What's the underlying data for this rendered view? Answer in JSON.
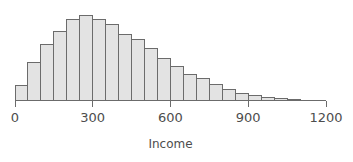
{
  "chart_data": {
    "type": "bar",
    "title": "",
    "subtitle": "",
    "xlabel": "Income",
    "ylabel": "",
    "grid": false,
    "legend": false,
    "legend_position": "none",
    "orientation": "vertical",
    "bin_width": 50,
    "xlim": [
      0,
      1200
    ],
    "ylim": [
      0,
      1
    ],
    "xticks": [
      0,
      300,
      600,
      900,
      1200
    ],
    "xtick_labels": [
      "0",
      "300",
      "600",
      "900",
      "1200"
    ],
    "yticks": [],
    "ytick_labels": [],
    "bar_fill_color": "#e3e3e3",
    "bar_edge_color": "#6b6b6b",
    "axis_color": "#6b6b6b",
    "text_color": "#4d4d4d",
    "background_color": "#ffffff",
    "bin_starts": [
      0,
      50,
      100,
      150,
      200,
      250,
      300,
      350,
      400,
      450,
      500,
      550,
      600,
      650,
      700,
      750,
      800,
      850,
      900,
      950,
      1000,
      1050,
      1100
    ],
    "bin_ends": [
      50,
      100,
      150,
      200,
      250,
      300,
      350,
      400,
      450,
      500,
      550,
      600,
      650,
      700,
      750,
      800,
      850,
      900,
      950,
      1000,
      1050,
      1100,
      1150
    ],
    "categories": [
      "0-50",
      "50-100",
      "100-150",
      "150-200",
      "200-250",
      "250-300",
      "300-350",
      "350-400",
      "400-450",
      "450-500",
      "500-550",
      "550-600",
      "600-650",
      "650-700",
      "700-750",
      "750-800",
      "800-850",
      "850-900",
      "900-950",
      "950-1000",
      "1000-1050",
      "1050-1100",
      "1100-1150"
    ],
    "values": [
      0.17,
      0.42,
      0.62,
      0.76,
      0.9,
      0.94,
      0.9,
      0.84,
      0.73,
      0.67,
      0.57,
      0.46,
      0.38,
      0.29,
      0.24,
      0.18,
      0.12,
      0.08,
      0.05,
      0.03,
      0.02,
      0.01,
      0.005
    ],
    "value_axis_note": "relative frequency (y-axis unlabeled, no ticks shown)"
  },
  "figure": {
    "caption": "",
    "axis_title": "Income"
  }
}
